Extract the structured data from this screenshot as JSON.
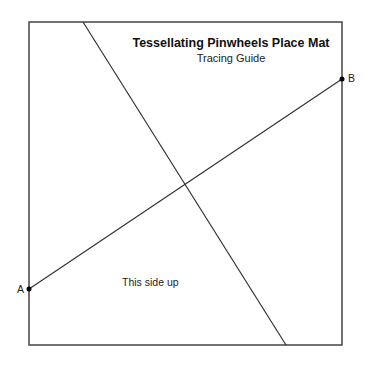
{
  "title": "Tessellating Pinwheels Place Mat",
  "subtitle": "Tracing Guide",
  "orientation_label": "This side up",
  "points": {
    "a": {
      "label": "A",
      "x": 29,
      "y": 289
    },
    "b": {
      "label": "B",
      "x": 342,
      "y": 79
    }
  },
  "square": {
    "x": 29,
    "y": 22,
    "width": 313,
    "height": 323
  },
  "lines": [
    {
      "name": "diagonal",
      "x1": 83,
      "y1": 22,
      "x2": 286,
      "y2": 345
    },
    {
      "name": "line-ab",
      "x1": 29,
      "y1": 289,
      "x2": 342,
      "y2": 79
    }
  ],
  "colors": {
    "stroke": "#333333",
    "point": "#000000"
  }
}
